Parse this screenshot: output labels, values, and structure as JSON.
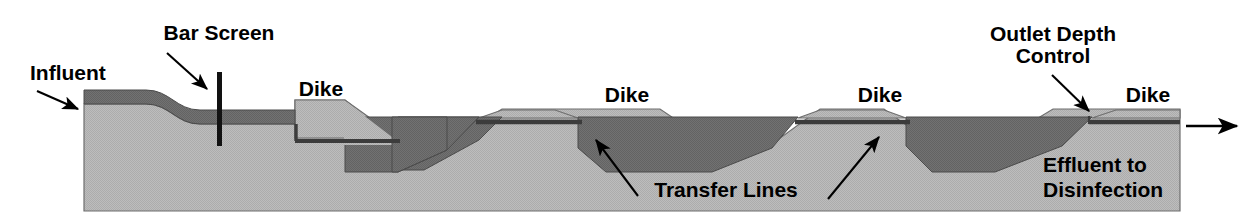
{
  "diagram": {
    "type": "process-cross-section",
    "colors": {
      "background": "#ffffff",
      "ground": "#b9b9b9",
      "water": "#6d6d6d",
      "outline": "#3a3a3a",
      "ink": "#000000",
      "bar_screen": "#111111"
    },
    "labels": {
      "influent": "Influent",
      "bar_screen": "Bar Screen",
      "dike_1": "Dike",
      "dike_2": "Dike",
      "dike_3": "Dike",
      "dike_4": "Dike",
      "outlet_depth_control_line1": "Outlet Depth",
      "outlet_depth_control_line2": "Control",
      "transfer_lines": "Transfer Lines",
      "effluent_line1": "Effluent to",
      "effluent_line2": "Disinfection"
    },
    "components": [
      {
        "name": "influent-channel",
        "label": "Influent",
        "kind": "inlet-channel"
      },
      {
        "name": "bar-screen",
        "label": "Bar Screen",
        "kind": "screening-device"
      },
      {
        "name": "dike-1",
        "label": "Dike",
        "kind": "earthen-embankment"
      },
      {
        "name": "lagoon-cell-1",
        "label": "",
        "kind": "lagoon-cell"
      },
      {
        "name": "dike-2",
        "label": "Dike",
        "kind": "earthen-embankment"
      },
      {
        "name": "lagoon-cell-2",
        "label": "",
        "kind": "lagoon-cell"
      },
      {
        "name": "dike-3",
        "label": "Dike",
        "kind": "earthen-embankment"
      },
      {
        "name": "lagoon-cell-3",
        "label": "",
        "kind": "lagoon-cell"
      },
      {
        "name": "outlet-depth-control",
        "label": "Outlet Depth Control",
        "kind": "outlet-structure"
      },
      {
        "name": "dike-4",
        "label": "Dike",
        "kind": "earthen-embankment"
      },
      {
        "name": "transfer-lines",
        "label": "Transfer Lines",
        "kind": "piping"
      },
      {
        "name": "effluent-outlet",
        "label": "Effluent to Disinfection",
        "kind": "outlet"
      }
    ],
    "flow_direction": "left-to-right"
  }
}
